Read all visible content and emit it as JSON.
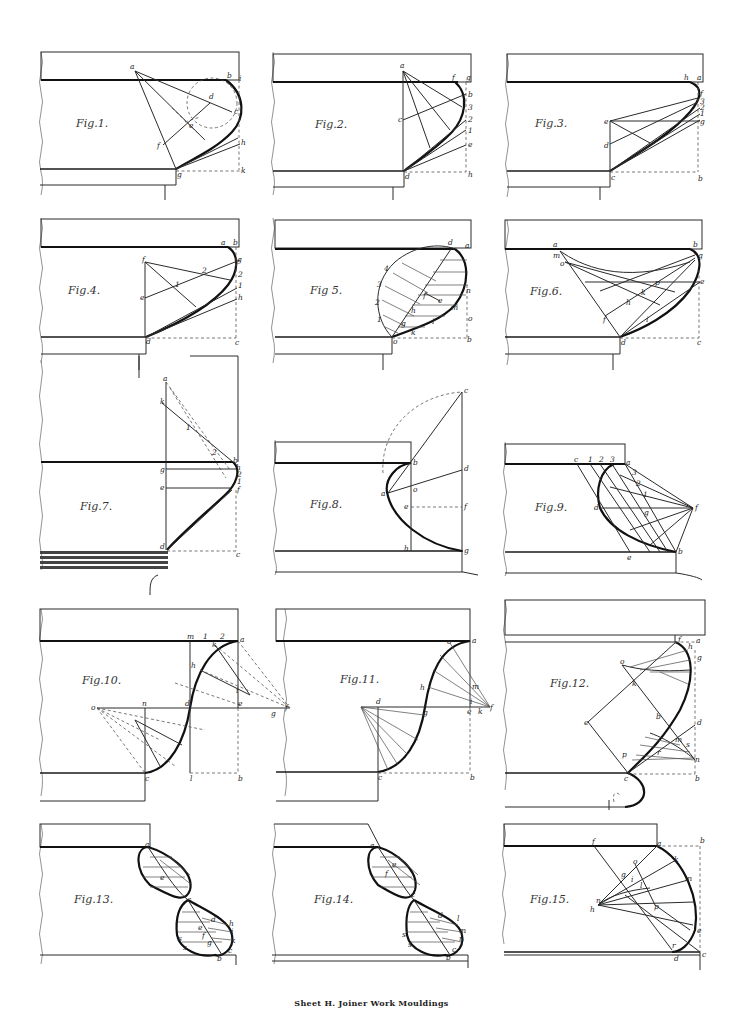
{
  "sheet": {
    "caption": "Sheet H.   Joiner Work Mouldings",
    "colors": {
      "ink": "#1a1a1a",
      "paper": "#ffffff",
      "construction": "#555555"
    }
  },
  "figures": [
    {
      "id": "fig1",
      "title": "Fig.1.",
      "labels": [
        "a",
        "b",
        "i",
        "d",
        "c",
        "e",
        "f",
        "h",
        "g",
        "k"
      ]
    },
    {
      "id": "fig2",
      "title": "Fig.2.",
      "labels": [
        "a",
        "f",
        "g",
        "b",
        "3",
        "2",
        "1",
        "e",
        "c",
        "d",
        "h"
      ]
    },
    {
      "id": "fig3",
      "title": "Fig.3.",
      "labels": [
        "h",
        "a",
        "f",
        "3",
        "2",
        "1",
        "g",
        "e",
        "d",
        "c",
        "b"
      ]
    },
    {
      "id": "fig4",
      "title": "Fig.4.",
      "labels": [
        "a",
        "b",
        "f",
        "g",
        "2",
        "1",
        "e",
        "h",
        "d",
        "c"
      ]
    },
    {
      "id": "fig5",
      "title": "Fig 5.",
      "labels": [
        "d",
        "a",
        "4",
        "3",
        "2",
        "1",
        "f",
        "e",
        "n",
        "m",
        "h",
        "g",
        "i",
        "k",
        "o",
        "b"
      ]
    },
    {
      "id": "fig6",
      "title": "Fig.6.",
      "labels": [
        "a",
        "m",
        "o",
        "b",
        "g",
        "p",
        "k",
        "h",
        "f",
        "i",
        "e",
        "d",
        "c"
      ]
    },
    {
      "id": "fig7",
      "title": "Fig.7.",
      "labels": [
        "a",
        "k",
        "1",
        "2",
        "b",
        "g",
        "h",
        "e",
        "f",
        "d",
        "c"
      ]
    },
    {
      "id": "fig8",
      "title": "Fig.8.",
      "labels": [
        "c",
        "b",
        "d",
        "a",
        "o",
        "e",
        "f",
        "h",
        "g"
      ]
    },
    {
      "id": "fig9",
      "title": "Fig.9.",
      "labels": [
        "c",
        "1",
        "2",
        "3",
        "a",
        "3",
        "2",
        "1",
        "f",
        "d",
        "g",
        "e",
        "b"
      ]
    },
    {
      "id": "fig10",
      "title": "Fig.10.",
      "labels": [
        "m",
        "1",
        "2",
        "k",
        "a",
        "h",
        "i",
        "o",
        "n",
        "d",
        "e",
        "g",
        "f",
        "c",
        "l",
        "b"
      ]
    },
    {
      "id": "fig11",
      "title": "Fig.11.",
      "labels": [
        "o",
        "a",
        "h",
        "m",
        "d",
        "g",
        "i",
        "e",
        "k",
        "f",
        "c",
        "b"
      ]
    },
    {
      "id": "fig12",
      "title": "Fig.12.",
      "labels": [
        "f",
        "a",
        "h",
        "g",
        "o",
        "k",
        "e",
        "b",
        "d",
        "m",
        "s",
        "p",
        "r",
        "n",
        "c"
      ]
    },
    {
      "id": "fig13",
      "title": "Fig.13.",
      "labels": [
        "a",
        "e",
        "c",
        "d",
        "h",
        "i",
        "k",
        "f",
        "g",
        "s",
        "c",
        "b"
      ]
    },
    {
      "id": "fig14",
      "title": "Fig.14.",
      "labels": [
        "a",
        "e",
        "f",
        "c",
        "d",
        "l",
        "m",
        "n",
        "s",
        "g",
        "b"
      ]
    },
    {
      "id": "fig15",
      "title": "Fig.15.",
      "labels": [
        "f",
        "a",
        "b",
        "o",
        "k",
        "g",
        "i",
        "l",
        "m",
        "n",
        "h",
        "p",
        "e",
        "r",
        "d",
        "c"
      ]
    }
  ]
}
